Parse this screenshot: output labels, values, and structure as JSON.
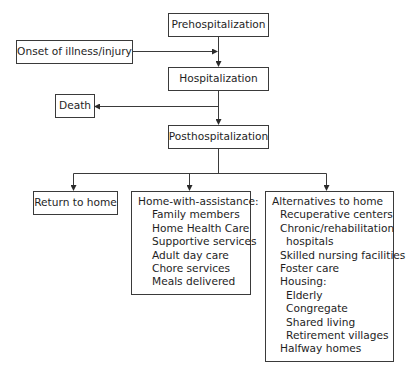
{
  "diagram": {
    "nodes": {
      "prehospitalization": "Prehospitalization",
      "onset": "Onset of illness/injury",
      "hospitalization": "Hospitalization",
      "death": "Death",
      "posthospitalization": "Posthospitalization",
      "return_home": "Return to home",
      "home_assistance": {
        "title": "Home-with-assistance:",
        "items": [
          "Family members",
          "Home Health Care",
          "Supportive services",
          "Adult day care",
          "Chore services",
          "Meals delivered"
        ]
      },
      "alternatives": {
        "title": "Alternatives to home",
        "lines": [
          "Recuperative centers",
          "Chronic/rehabilitation",
          "hospitals",
          "Skilled nursing facilities",
          "Foster care",
          "Housing:",
          "Elderly",
          "Congregate",
          "Shared living",
          "Retirement villages",
          "Halfway homes"
        ]
      }
    },
    "edges": [
      {
        "from": "Prehospitalization",
        "to": "Hospitalization"
      },
      {
        "from": "Onset of illness/injury",
        "to": "Hospitalization"
      },
      {
        "from": "Hospitalization",
        "to": "Death"
      },
      {
        "from": "Hospitalization",
        "to": "Posthospitalization"
      },
      {
        "from": "Posthospitalization",
        "to": "Return to home"
      },
      {
        "from": "Posthospitalization",
        "to": "Home-with-assistance"
      },
      {
        "from": "Posthospitalization",
        "to": "Alternatives to home"
      }
    ]
  }
}
